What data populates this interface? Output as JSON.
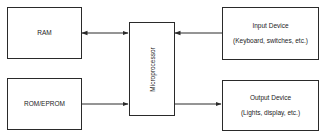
{
  "diagram": {
    "type": "block-diagram",
    "nodes": [
      {
        "id": "ram",
        "label": "RAM"
      },
      {
        "id": "rom",
        "label": "ROM/EPROM"
      },
      {
        "id": "cpu",
        "label": "Microprocessor"
      },
      {
        "id": "input",
        "label": "Input Device",
        "sublabel": "(Keyboard, switches, etc.)"
      },
      {
        "id": "output",
        "label": "Output Device",
        "sublabel": "(Lights, display, etc.)"
      }
    ],
    "edges": [
      {
        "from": "ram",
        "to": "cpu",
        "direction": "bidirectional"
      },
      {
        "from": "rom",
        "to": "cpu",
        "direction": "forward"
      },
      {
        "from": "input",
        "to": "cpu",
        "direction": "forward"
      },
      {
        "from": "cpu",
        "to": "output",
        "direction": "forward"
      }
    ],
    "colors": {
      "line": "#2a2a2a",
      "background": "#ffffff"
    }
  }
}
